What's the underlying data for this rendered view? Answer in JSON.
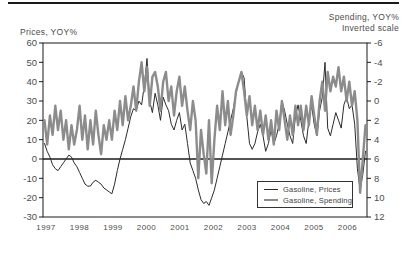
{
  "header": {
    "left_axis_title": "Prices, YOY%",
    "right_axis_title_line1": "Spending, YOY%",
    "right_axis_title_line2": "Inverted scale"
  },
  "colors": {
    "prices_line": "#2b2b2b",
    "spending_line": "#8c8c8c",
    "axis": "#1a1a1a",
    "text": "#4d4d4d"
  },
  "chart_data": {
    "type": "line",
    "title": "",
    "x_frequency": "monthly",
    "x_start": "1997-01",
    "x_end": "2006-12",
    "x_tick_labels": [
      "1997",
      "1998",
      "1999",
      "2000",
      "2001",
      "2002",
      "2003",
      "2004",
      "2005",
      "2006"
    ],
    "left_axis": {
      "label": "Prices, YOY%",
      "ticks": [
        60,
        50,
        40,
        30,
        20,
        10,
        0,
        -10,
        -20,
        -30
      ],
      "range": [
        -30,
        60
      ]
    },
    "right_axis": {
      "label": "Spending, YOY% Inverted scale",
      "ticks": [
        -6,
        -4,
        -2,
        0,
        2,
        4,
        6,
        8,
        10,
        12
      ],
      "range": [
        -6,
        12
      ],
      "inverted": true
    },
    "zero_line_left_axis": 0,
    "legend_position": "bottom-right",
    "series": [
      {
        "name": "Gasoline, Prices",
        "axis": "left",
        "color": "#2b2b2b",
        "stroke_width": 1,
        "values": [
          8,
          4,
          1,
          -3,
          -5,
          -6,
          -4,
          -2,
          0,
          2,
          1,
          -2,
          -4,
          -7,
          -10,
          -13,
          -14,
          -14,
          -12,
          -11,
          -12,
          -13,
          -15,
          -16,
          -17,
          -18,
          -13,
          -6,
          0,
          5,
          10,
          16,
          22,
          26,
          25,
          30,
          28,
          38,
          52,
          30,
          24,
          34,
          28,
          20,
          32,
          28,
          25,
          18,
          15,
          20,
          24,
          15,
          18,
          8,
          -2,
          -6,
          -10,
          -16,
          -21,
          -23,
          -22,
          -24,
          -20,
          -16,
          -10,
          -4,
          2,
          8,
          14,
          20,
          26,
          34,
          40,
          45,
          42,
          22,
          8,
          5,
          8,
          14,
          18,
          12,
          4,
          8,
          15,
          8,
          12,
          18,
          30,
          25,
          18,
          12,
          8,
          22,
          28,
          20,
          12,
          8,
          20,
          28,
          18,
          12,
          25,
          32,
          50,
          16,
          12,
          18,
          24,
          20,
          16,
          28,
          32,
          26,
          28,
          18,
          -5,
          -16,
          -8,
          4
        ]
      },
      {
        "name": "Gasoline, Spending",
        "axis": "right",
        "color": "#8c8c8c",
        "stroke_width": 2.4,
        "values": [
          2.0,
          4.5,
          1.5,
          3.5,
          0.5,
          3.0,
          1.0,
          4.0,
          2.0,
          5.0,
          2.5,
          4.5,
          3.0,
          0.5,
          4.0,
          1.5,
          5.0,
          2.0,
          4.5,
          1.0,
          3.5,
          5.5,
          2.5,
          4.0,
          2.0,
          4.0,
          1.0,
          3.0,
          0.0,
          2.5,
          -0.5,
          2.0,
          0.5,
          -1.5,
          1.0,
          -2.0,
          -4.0,
          -1.0,
          -3.5,
          0.5,
          -2.5,
          -3.0,
          -1.5,
          1.0,
          -2.0,
          -3.0,
          0.0,
          -1.5,
          1.5,
          -1.0,
          -2.5,
          0.5,
          -1.5,
          1.0,
          3.0,
          0.0,
          2.0,
          8.0,
          3.0,
          5.5,
          7.5,
          2.0,
          8.5,
          4.0,
          0.5,
          3.0,
          -1.0,
          2.5,
          0.0,
          3.5,
          1.5,
          -1.0,
          -2.0,
          -3.0,
          -1.0,
          1.5,
          -0.5,
          2.5,
          0.5,
          3.0,
          1.0,
          3.5,
          1.5,
          4.0,
          2.0,
          4.5,
          1.0,
          3.0,
          0.0,
          2.0,
          4.0,
          1.5,
          3.5,
          0.5,
          2.5,
          0.5,
          3.0,
          0.5,
          2.5,
          -0.5,
          1.5,
          3.5,
          0.0,
          -2.0,
          1.0,
          -3.0,
          -1.0,
          -2.5,
          -1.5,
          -3.5,
          -1.0,
          -2.5,
          0.0,
          -2.0,
          0.5,
          -1.0,
          2.0,
          9.5,
          6.0,
          2.5
        ]
      }
    ],
    "legend_entries": [
      "Gasoline, Prices",
      "Gasoline, Spending"
    ]
  }
}
